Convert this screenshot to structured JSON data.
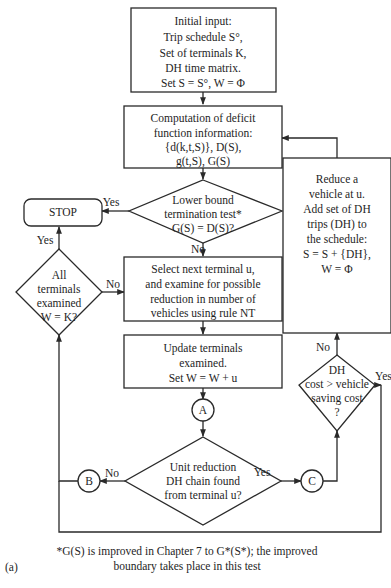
{
  "figure": {
    "panel_label": "(a)",
    "footnote": [
      "*G(S) is improved in Chapter 7 to G*(S*); the improved",
      "boundary takes place in this test"
    ]
  },
  "nodes": {
    "initial_input": {
      "type": "process",
      "lines": [
        "Initial input:",
        "Trip schedule S°,",
        "Set of terminals K,",
        "DH time matrix.",
        "Set S = S°, W = Φ"
      ]
    },
    "deficit_computation": {
      "type": "process",
      "lines": [
        "Computation of deficit",
        "function information:",
        "{d(k,t,S)}, D(S),",
        "g(t,S), G(S)"
      ]
    },
    "lower_bound_test": {
      "type": "decision",
      "lines": [
        "Lower bound",
        "termination test*",
        "G(S) = D(S)?"
      ]
    },
    "stop": {
      "type": "terminal",
      "lines": [
        "STOP"
      ]
    },
    "all_terminals_examined": {
      "type": "decision",
      "lines": [
        "All",
        "terminals",
        "examined",
        "W = K?"
      ]
    },
    "select_next_terminal": {
      "type": "process",
      "lines": [
        "Select next terminal u,",
        "and examine for possible",
        "reduction in number of",
        "vehicles using rule NT"
      ]
    },
    "update_terminals": {
      "type": "process",
      "lines": [
        "Update terminals",
        "examined.",
        "Set W = W + u"
      ]
    },
    "unit_reduction_test": {
      "type": "decision",
      "lines": [
        "Unit reduction",
        "DH chain found",
        "from terminal u?"
      ]
    },
    "dh_cost_test": {
      "type": "decision",
      "lines": [
        "DH",
        "cost > vehicle",
        "saving cost",
        "?"
      ]
    },
    "reduce_vehicle": {
      "type": "process",
      "lines": [
        "Reduce a",
        "vehicle at u.",
        "Add set of DH",
        "trips (DH) to",
        "the schedule:",
        "S = S + {DH},",
        "W = Φ"
      ]
    },
    "connector_a": {
      "type": "connector",
      "lines": [
        "A"
      ]
    },
    "connector_b": {
      "type": "connector",
      "lines": [
        "B"
      ]
    },
    "connector_c": {
      "type": "connector",
      "lines": [
        "C"
      ]
    }
  },
  "edge_labels": {
    "lower_bound_yes": "Yes",
    "lower_bound_no": "No",
    "all_examined_yes": "Yes",
    "all_examined_no": "No",
    "unit_reduction_yes": "Yes",
    "unit_reduction_no": "No",
    "dh_cost_yes": "Yes",
    "dh_cost_no": "No"
  },
  "edges": [
    {
      "from": "initial_input",
      "to": "deficit_computation"
    },
    {
      "from": "deficit_computation",
      "to": "lower_bound_test"
    },
    {
      "from": "lower_bound_test",
      "to": "stop",
      "label": "Yes"
    },
    {
      "from": "lower_bound_test",
      "to": "select_next_terminal",
      "label": "No"
    },
    {
      "from": "select_next_terminal",
      "to": "update_terminals"
    },
    {
      "from": "update_terminals",
      "to": "connector_a"
    },
    {
      "from": "connector_a",
      "to": "unit_reduction_test"
    },
    {
      "from": "unit_reduction_test",
      "to": "connector_c",
      "label": "Yes"
    },
    {
      "from": "unit_reduction_test",
      "to": "connector_b",
      "label": "No"
    },
    {
      "from": "connector_b",
      "to": "all_terminals_examined"
    },
    {
      "from": "all_terminals_examined",
      "to": "stop",
      "label": "Yes"
    },
    {
      "from": "all_terminals_examined",
      "to": "select_next_terminal",
      "label": "No"
    },
    {
      "from": "connector_c",
      "to": "dh_cost_test"
    },
    {
      "from": "dh_cost_test",
      "to": "reduce_vehicle",
      "label": "No"
    },
    {
      "from": "dh_cost_test",
      "to": "unit_reduction_test",
      "label": "Yes"
    },
    {
      "from": "reduce_vehicle",
      "to": "deficit_computation"
    }
  ]
}
